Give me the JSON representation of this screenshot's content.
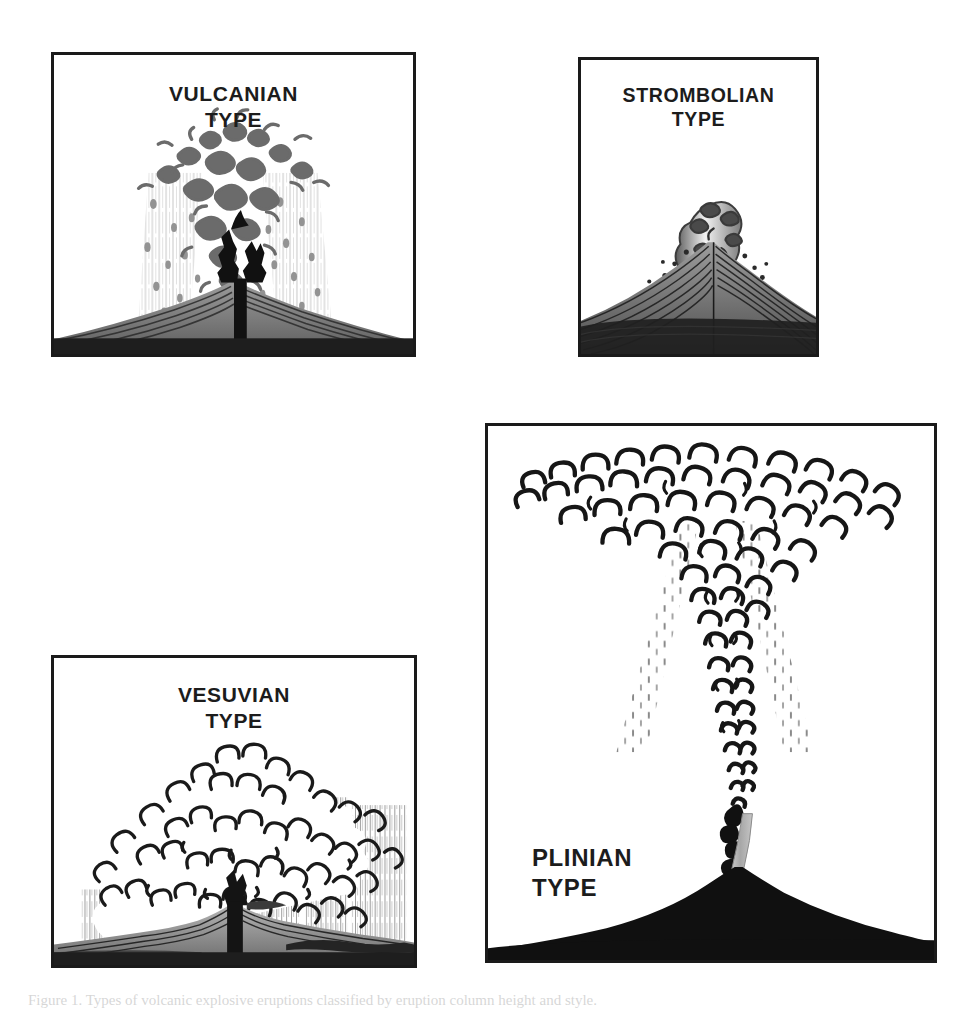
{
  "figure": {
    "background_color": "#ffffff",
    "ink_color": "#1a1a1a",
    "panel_border_color": "#1a1a1a",
    "caption": "Figure 1. Types of volcanic explosive eruptions classified by eruption column height and style."
  },
  "panels": [
    {
      "id": "vulcanian",
      "title": "VULCANIAN\nTYPE",
      "name_line1": "VULCANIAN",
      "name_line2": "TYPE",
      "description": "Dense dark ash cloud of discrete blobs rising above a low stratified cone with a notched summit crater, with heavy vertical ash fallout streaks on both flanks.",
      "plume_style": "dark-blob-cloud",
      "plume_color": "#6e6e6e",
      "fallout": "vertical-streaks-with-lapilli",
      "cone_style": "layered-gray-stratified-cone",
      "cone_color": "#7a7a7a",
      "ground_color": "#1e1e1e"
    },
    {
      "id": "strombolian",
      "title": "STROMBOLIAN\nTYPE",
      "name_line1": "STROMBOLIAN",
      "name_line2": "TYPE",
      "description": "Small gray-and-white jet of gas and incandescent clots above the crater with scattered ballistic bombs arcing out on both sides of a broad layered cone.",
      "plume_style": "small-gray-white-jet",
      "plume_color": "#6b6b6b",
      "fallout": "scattered-ballistic-dots",
      "cone_style": "layered-gray-stratified-cone",
      "cone_color": "#6f6f6f",
      "ground_color": "#1e1e1e"
    },
    {
      "id": "vesuvian",
      "title": "VESUVIAN\nTYPE",
      "name_line1": "VESUVIAN",
      "name_line2": "TYPE",
      "description": "Very broad low billowing white cloud of outlined convolutions spreading sideways above a low cone, with stippled vertical ash fall at the left and right margins.",
      "plume_style": "broad-outlined-billowing-cloud",
      "plume_color": "#ffffff",
      "fallout": "stippled-vertical-ashfall",
      "cone_style": "low-ridged-cone-with-dark-vent",
      "cone_color": "#8a8a8a",
      "ground_color": "#222222"
    },
    {
      "id": "plinian",
      "title": "PLINIAN\nTYPE",
      "name_line1": "PLINIAN",
      "name_line2": "TYPE",
      "description": "Tall narrow vertical eruption column rising from a small vent and spreading into a very wide umbrella-shaped cloud at the top, with fine ash fallout raining down on both sides; solid black mountain silhouette at the base.",
      "plume_style": "tall-column-with-umbrella-canopy",
      "plume_color": "#ffffff",
      "fallout": "fine-dashed-ashfall",
      "cone_style": "solid-black-silhouette",
      "cone_color": "#101010",
      "ground_color": "#101010"
    }
  ]
}
